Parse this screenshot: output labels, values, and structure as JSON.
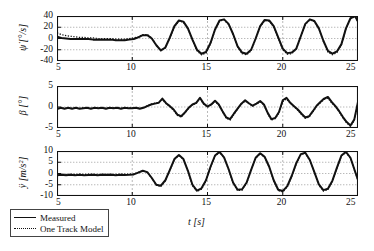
{
  "figure": {
    "title": "",
    "xlabel": "t [s]",
    "legend": {
      "position": "below-left",
      "entries": [
        {
          "label": "Measured",
          "style": "solid"
        },
        {
          "label": "One Track Model",
          "style": "dotted"
        }
      ]
    }
  },
  "chart_data": [
    {
      "type": "line",
      "panel": 1,
      "title": "",
      "xlabel": "",
      "ylabel": "ψ̇ [°/s]",
      "ylabel_plain": "yaw-rate",
      "xlim": [
        5,
        25
      ],
      "ylim": [
        -40,
        40
      ],
      "xticks": [
        5,
        10,
        15,
        20,
        25
      ],
      "yticks": [
        40,
        20,
        0,
        -20,
        -40
      ],
      "grid": true,
      "series": [
        {
          "name": "Measured",
          "style": "solid",
          "x": [
            5.0,
            5.3,
            5.6,
            5.9,
            6.2,
            6.5,
            6.8,
            7.1,
            7.4,
            7.7,
            8.0,
            8.3,
            8.6,
            8.9,
            9.2,
            9.5,
            9.8,
            10.1,
            10.4,
            10.7,
            11.0,
            11.3,
            11.6,
            11.9,
            12.2,
            12.5,
            12.8,
            13.1,
            13.4,
            13.7,
            14.0,
            14.3,
            14.6,
            14.9,
            15.2,
            15.5,
            15.8,
            16.1,
            16.4,
            16.7,
            17.0,
            17.3,
            17.6,
            17.9,
            18.2,
            18.5,
            18.8,
            19.1,
            19.4,
            19.7,
            20.0,
            20.3,
            20.6,
            20.9,
            21.2,
            21.5,
            21.8,
            22.1,
            22.4,
            22.7,
            23.0,
            23.3,
            23.6,
            23.9,
            24.2,
            24.5,
            24.8,
            25.0
          ],
          "y": [
            3,
            1,
            0,
            -1,
            -1,
            -1,
            -1,
            -1,
            -2,
            -2,
            -2,
            -2,
            -2,
            -3,
            -3,
            -3,
            -2,
            -1,
            2,
            6,
            6,
            0,
            -12,
            -21,
            -16,
            2,
            22,
            32,
            30,
            18,
            -2,
            -20,
            -27,
            -24,
            -8,
            16,
            32,
            34,
            26,
            8,
            -14,
            -25,
            -27,
            -20,
            0,
            22,
            33,
            32,
            22,
            2,
            -18,
            -26,
            -25,
            -18,
            4,
            26,
            34,
            31,
            18,
            -4,
            -22,
            -27,
            -23,
            -10,
            18,
            36,
            40,
            30
          ]
        },
        {
          "name": "One Track Model",
          "style": "dotted",
          "x": [
            5.0,
            5.3,
            5.6,
            5.9,
            6.2,
            6.5,
            6.8,
            7.1,
            7.4,
            7.7,
            8.0,
            8.3,
            8.6,
            8.9,
            9.2,
            9.5,
            9.8,
            10.1,
            10.4,
            10.7,
            11.0,
            11.3,
            11.6,
            11.9,
            12.2,
            12.5,
            12.8,
            13.1,
            13.4,
            13.7,
            14.0,
            14.3,
            14.6,
            14.9,
            15.2,
            15.5,
            15.8,
            16.1,
            16.4,
            16.7,
            17.0,
            17.3,
            17.6,
            17.9,
            18.2,
            18.5,
            18.8,
            19.1,
            19.4,
            19.7,
            20.0,
            20.3,
            20.6,
            20.9,
            21.2,
            21.5,
            21.8,
            22.1,
            22.4,
            22.7,
            23.0,
            23.3,
            23.6,
            23.9,
            24.2,
            24.5,
            24.8,
            25.0
          ],
          "y": [
            10,
            7,
            5,
            4,
            3,
            2,
            2,
            1,
            1,
            0,
            0,
            0,
            0,
            -1,
            -1,
            -1,
            0,
            1,
            3,
            7,
            7,
            1,
            -12,
            -22,
            -17,
            1,
            21,
            31,
            29,
            17,
            -3,
            -22,
            -29,
            -26,
            -9,
            15,
            31,
            33,
            25,
            7,
            -15,
            -27,
            -29,
            -22,
            -1,
            21,
            32,
            31,
            21,
            1,
            -20,
            -28,
            -27,
            -19,
            3,
            25,
            33,
            30,
            17,
            -5,
            -24,
            -29,
            -25,
            -11,
            17,
            35,
            39,
            29
          ]
        }
      ]
    },
    {
      "type": "line",
      "panel": 2,
      "title": "",
      "xlabel": "",
      "ylabel": "β [°]",
      "ylabel_plain": "side-slip-angle",
      "xlim": [
        5,
        25
      ],
      "ylim": [
        -5,
        5
      ],
      "xticks": [
        5,
        10,
        15,
        20,
        25
      ],
      "yticks": [
        5,
        0,
        -5
      ],
      "grid": true,
      "series": [
        {
          "name": "Measured",
          "style": "solid",
          "x": [
            5.0,
            5.25,
            5.5,
            5.75,
            6.0,
            6.25,
            6.5,
            6.75,
            7.0,
            7.25,
            7.5,
            7.75,
            8.0,
            8.25,
            8.5,
            8.75,
            9.0,
            9.25,
            9.5,
            9.75,
            10.0,
            10.25,
            10.5,
            10.75,
            11.0,
            11.25,
            11.5,
            11.75,
            12.0,
            12.25,
            12.5,
            12.75,
            13.0,
            13.25,
            13.5,
            13.75,
            14.0,
            14.25,
            14.5,
            14.75,
            15.0,
            15.25,
            15.5,
            15.75,
            16.0,
            16.25,
            16.5,
            16.75,
            17.0,
            17.25,
            17.5,
            17.75,
            18.0,
            18.25,
            18.5,
            18.75,
            19.0,
            19.25,
            19.5,
            19.75,
            20.0,
            20.25,
            20.5,
            20.75,
            21.0,
            21.25,
            21.5,
            21.75,
            22.0,
            22.25,
            22.5,
            22.75,
            23.0,
            23.25,
            23.5,
            23.75,
            24.0,
            24.25,
            24.5,
            24.75,
            25.0
          ],
          "y": [
            -0.5,
            -0.2,
            -0.4,
            -0.2,
            -0.4,
            -0.2,
            -0.4,
            -0.3,
            -0.2,
            -0.4,
            -0.2,
            -0.3,
            -0.2,
            -0.4,
            -0.2,
            -0.3,
            -0.2,
            -0.4,
            -0.2,
            -0.3,
            -0.3,
            -0.2,
            -0.4,
            -0.2,
            0.2,
            0.6,
            0.8,
            1.0,
            2.0,
            0.9,
            0.2,
            -0.6,
            -1.8,
            -2.2,
            -1.3,
            -0.2,
            0.6,
            1.0,
            2.2,
            0.8,
            0.1,
            0.6,
            1.5,
            0.6,
            -1.0,
            -2.5,
            -2.9,
            -1.6,
            -0.4,
            0.8,
            1.6,
            0.9,
            0.3,
            0.8,
            1.4,
            0.6,
            -1.4,
            -2.9,
            -2.6,
            -1.2,
            1.6,
            2.2,
            1.0,
            0.2,
            -0.6,
            -1.6,
            -2.5,
            -2.2,
            -1.0,
            0.3,
            1.2,
            2.0,
            2.4,
            1.2,
            0.2,
            -1.0,
            -2.4,
            -3.6,
            -4.4,
            -3.0,
            1.2
          ]
        },
        {
          "name": "One Track Model",
          "style": "dotted",
          "x": [
            5.0,
            5.25,
            5.5,
            5.75,
            6.0,
            6.25,
            6.5,
            6.75,
            7.0,
            7.25,
            7.5,
            7.75,
            8.0,
            8.25,
            8.5,
            8.75,
            9.0,
            9.25,
            9.5,
            9.75,
            10.0,
            10.25,
            10.5,
            10.75,
            11.0,
            11.25,
            11.5,
            11.75,
            12.0,
            12.25,
            12.5,
            12.75,
            13.0,
            13.25,
            13.5,
            13.75,
            14.0,
            14.25,
            14.5,
            14.75,
            15.0,
            15.25,
            15.5,
            15.75,
            16.0,
            16.25,
            16.5,
            16.75,
            17.0,
            17.25,
            17.5,
            17.75,
            18.0,
            18.25,
            18.5,
            18.75,
            19.0,
            19.25,
            19.5,
            19.75,
            20.0,
            20.25,
            20.5,
            20.75,
            21.0,
            21.25,
            21.5,
            21.75,
            22.0,
            22.25,
            22.5,
            22.75,
            23.0,
            23.25,
            23.5,
            23.75,
            24.0,
            24.25,
            24.5,
            24.75,
            25.0
          ],
          "y": [
            -0.3,
            -0.2,
            -0.3,
            -0.2,
            -0.3,
            -0.2,
            -0.3,
            -0.2,
            -0.2,
            -0.3,
            -0.2,
            -0.2,
            -0.2,
            -0.3,
            -0.2,
            -0.2,
            -0.2,
            -0.3,
            -0.2,
            -0.2,
            -0.2,
            -0.2,
            -0.3,
            -0.1,
            0.3,
            0.7,
            0.9,
            1.1,
            1.7,
            0.8,
            0.1,
            -0.8,
            -2.0,
            -2.4,
            -1.4,
            -0.3,
            0.5,
            0.9,
            1.9,
            0.7,
            0.0,
            0.5,
            1.3,
            0.5,
            -1.2,
            -2.7,
            -3.1,
            -1.8,
            -0.5,
            0.7,
            1.4,
            0.8,
            0.2,
            0.7,
            1.2,
            0.5,
            -1.6,
            -3.1,
            -2.8,
            -1.4,
            1.3,
            1.9,
            0.9,
            0.1,
            -0.8,
            -1.8,
            -2.7,
            -2.4,
            -1.2,
            0.2,
            1.0,
            1.8,
            2.1,
            1.0,
            0.1,
            -1.2,
            -2.6,
            -3.8,
            -4.6,
            -3.2,
            1.0
          ]
        }
      ]
    },
    {
      "type": "line",
      "panel": 3,
      "title": "",
      "xlabel": "t [s]",
      "ylabel": "ÿ [m/s²]",
      "ylabel_plain": "lateral-acceleration",
      "xlim": [
        5,
        25
      ],
      "ylim": [
        -10,
        10
      ],
      "xticks": [
        5,
        10,
        15,
        20,
        25
      ],
      "yticks": [
        10,
        5,
        0,
        -5,
        -10
      ],
      "grid": true,
      "series": [
        {
          "name": "Measured",
          "style": "solid",
          "x": [
            5.0,
            5.3,
            5.6,
            5.9,
            6.2,
            6.5,
            6.8,
            7.1,
            7.4,
            7.7,
            8.0,
            8.3,
            8.6,
            8.9,
            9.2,
            9.5,
            9.8,
            10.1,
            10.4,
            10.7,
            11.0,
            11.3,
            11.6,
            11.9,
            12.2,
            12.5,
            12.8,
            13.1,
            13.4,
            13.7,
            14.0,
            14.3,
            14.6,
            14.9,
            15.2,
            15.5,
            15.8,
            16.1,
            16.4,
            16.7,
            17.0,
            17.3,
            17.6,
            17.9,
            18.2,
            18.5,
            18.8,
            19.1,
            19.4,
            19.7,
            20.0,
            20.3,
            20.6,
            20.9,
            21.2,
            21.5,
            21.8,
            22.1,
            22.4,
            22.7,
            23.0,
            23.3,
            23.6,
            23.9,
            24.2,
            24.5,
            24.8,
            25.0
          ],
          "y": [
            -0.8,
            -0.6,
            -0.8,
            -0.6,
            -0.8,
            -0.6,
            -0.8,
            -0.7,
            -0.6,
            -0.8,
            -0.6,
            -0.7,
            -0.6,
            -0.8,
            -0.6,
            -0.7,
            -0.6,
            -0.4,
            0.4,
            1.2,
            0.6,
            -2.0,
            -5.0,
            -5.4,
            -3.0,
            1.6,
            6.4,
            8.2,
            6.4,
            1.2,
            -5.0,
            -7.6,
            -6.6,
            -3.0,
            3.0,
            8.0,
            9.6,
            7.2,
            2.0,
            -4.0,
            -7.2,
            -7.0,
            -4.0,
            1.6,
            7.0,
            9.0,
            7.4,
            3.0,
            -3.0,
            -7.2,
            -7.8,
            -5.6,
            -1.0,
            4.6,
            8.6,
            9.2,
            6.0,
            0.6,
            -4.8,
            -7.4,
            -6.8,
            -3.2,
            2.6,
            8.0,
            9.6,
            7.0,
            1.0,
            -2.8
          ]
        },
        {
          "name": "One Track Model",
          "style": "dotted",
          "x": [
            5.0,
            5.3,
            5.6,
            5.9,
            6.2,
            6.5,
            6.8,
            7.1,
            7.4,
            7.7,
            8.0,
            8.3,
            8.6,
            8.9,
            9.2,
            9.5,
            9.8,
            10.1,
            10.4,
            10.7,
            11.0,
            11.3,
            11.6,
            11.9,
            12.2,
            12.5,
            12.8,
            13.1,
            13.4,
            13.7,
            14.0,
            14.3,
            14.6,
            14.9,
            15.2,
            15.5,
            15.8,
            16.1,
            16.4,
            16.7,
            17.0,
            17.3,
            17.6,
            17.9,
            18.2,
            18.5,
            18.8,
            19.1,
            19.4,
            19.7,
            20.0,
            20.3,
            20.6,
            20.9,
            21.2,
            21.5,
            21.8,
            22.1,
            22.4,
            22.7,
            23.0,
            23.3,
            23.6,
            23.9,
            24.2,
            24.5,
            24.8,
            25.0
          ],
          "y": [
            -0.4,
            -0.3,
            -0.4,
            -0.3,
            -0.4,
            -0.3,
            -0.4,
            -0.3,
            -0.3,
            -0.4,
            -0.3,
            -0.3,
            -0.3,
            -0.4,
            -0.3,
            -0.3,
            -0.3,
            -0.2,
            0.5,
            1.2,
            0.6,
            -2.2,
            -5.2,
            -5.8,
            -3.3,
            1.4,
            6.2,
            8.0,
            6.2,
            1.0,
            -5.4,
            -8.0,
            -7.0,
            -3.3,
            2.8,
            7.8,
            9.4,
            7.0,
            1.8,
            -4.3,
            -7.6,
            -7.4,
            -4.3,
            1.4,
            6.8,
            8.8,
            7.2,
            2.8,
            -3.3,
            -7.6,
            -8.2,
            -6.0,
            -1.2,
            4.4,
            8.4,
            9.0,
            5.8,
            0.4,
            -5.2,
            -7.8,
            -7.2,
            -3.5,
            2.4,
            7.8,
            9.4,
            6.8,
            0.8,
            -3.0
          ]
        }
      ]
    }
  ]
}
